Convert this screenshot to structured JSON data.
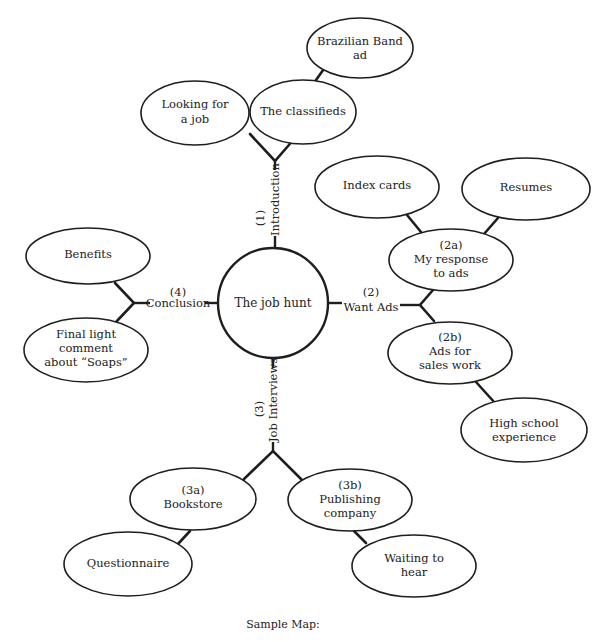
{
  "diagram": {
    "type": "mind-map",
    "caption": "Sample Map:",
    "hub": {
      "label": "The job hunt"
    },
    "branches": [
      {
        "number": "(1)",
        "label": "Introduction"
      },
      {
        "number": "(2)",
        "label": "Want Ads"
      },
      {
        "number": "(3)",
        "label": "Job Interviews"
      },
      {
        "number": "(4)",
        "label": "Conclusion"
      }
    ],
    "nodes": {
      "looking_for_job": {
        "lines": [
          "Looking for",
          "a job"
        ]
      },
      "classifieds": {
        "lines": [
          "The classifieds"
        ]
      },
      "brazilian_band": {
        "lines": [
          "Brazilian Band",
          "ad"
        ]
      },
      "index_cards": {
        "lines": [
          "Index cards"
        ]
      },
      "resumes": {
        "lines": [
          "Resumes"
        ]
      },
      "response_to_ads": {
        "lines": [
          "(2a)",
          "My response",
          "to ads"
        ]
      },
      "ads_sales_work": {
        "lines": [
          "(2b)",
          "Ads for",
          "sales work"
        ]
      },
      "high_school": {
        "lines": [
          "High school",
          "experience"
        ]
      },
      "bookstore": {
        "lines": [
          "(3a)",
          "Bookstore"
        ]
      },
      "questionnaire": {
        "lines": [
          "Questionnaire"
        ]
      },
      "publishing": {
        "lines": [
          "(3b)",
          "Publishing",
          "company"
        ]
      },
      "waiting": {
        "lines": [
          "Waiting to",
          "hear"
        ]
      },
      "benefits": {
        "lines": [
          "Benefits"
        ]
      },
      "final_comment": {
        "lines": [
          "Final light",
          "comment",
          "about “Soaps”"
        ]
      }
    }
  }
}
